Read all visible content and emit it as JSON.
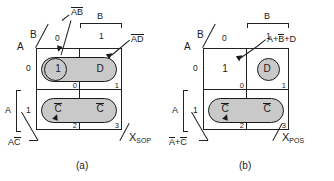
{
  "figures": [
    {
      "id": "a",
      "caption": "(a)",
      "axis": {
        "row_var": "A",
        "col_var": "B",
        "col_header_var": "B",
        "col_bit_0": "0",
        "col_bit_1": "1",
        "row_bit_0": "0",
        "row_bit_1": "1",
        "row_group_var": "A"
      },
      "cells": [
        {
          "index": "0",
          "value": "1",
          "overbar": false
        },
        {
          "index": "1",
          "value": "D",
          "overbar": false
        },
        {
          "index": "2",
          "value": "C",
          "overbar": true
        },
        {
          "index": "3",
          "value": "C",
          "overbar": true
        }
      ],
      "callouts": [
        {
          "name": "a-not-b-not",
          "text_pre": "",
          "over": "AB",
          "text_post": "",
          "display": "A̅B̅"
        },
        {
          "name": "a-not-d",
          "display": "A̅D"
        },
        {
          "name": "a-c-not",
          "display": "AC̅"
        }
      ],
      "output": {
        "symbol": "X",
        "subscript": "SOP"
      }
    },
    {
      "id": "b",
      "caption": "(b)",
      "axis": {
        "row_var": "A",
        "col_var": "B",
        "col_header_var": "B",
        "col_bit_0": "0",
        "col_bit_1": "1",
        "row_bit_0": "0",
        "row_bit_1": "1",
        "row_group_var": "A"
      },
      "cells": [
        {
          "index": "0",
          "value": "1",
          "overbar": false
        },
        {
          "index": "1",
          "value": "D",
          "overbar": false
        },
        {
          "index": "2",
          "value": "C",
          "overbar": true
        },
        {
          "index": "3",
          "value": "C",
          "overbar": true
        }
      ],
      "callouts": [
        {
          "name": "a-or-bnot-or-d",
          "display": "A+B̅+D"
        },
        {
          "name": "anot-or-cnot",
          "display": "A̅+C̅"
        }
      ],
      "output": {
        "symbol": "X",
        "subscript": "POS"
      }
    }
  ],
  "labels": {
    "fig_a_top_callout": "AB",
    "fig_a_right_callout": "AD",
    "fig_a_bottom_callout": "AC",
    "fig_b_right_callout_a": "A+",
    "fig_b_right_callout_b": "B",
    "fig_b_right_callout_c": "+D",
    "fig_b_bottom_callout_a": "A",
    "fig_b_bottom_callout_b": "+C",
    "caption_a": "(a)",
    "caption_b": "(b)",
    "bit_zero": "0",
    "bit_one": "1",
    "var_a": "A",
    "var_b": "B",
    "var_c": "C",
    "var_d": "D",
    "idx_0": "0",
    "idx_1": "1",
    "idx_2": "2",
    "idx_3": "3",
    "x_symbol": "X",
    "sub_sop": "SOP",
    "sub_pos": "POS"
  },
  "colors": {
    "loop_fill": "#c9c9c9",
    "line": "#1a1a1a",
    "background": "#ffffff"
  }
}
